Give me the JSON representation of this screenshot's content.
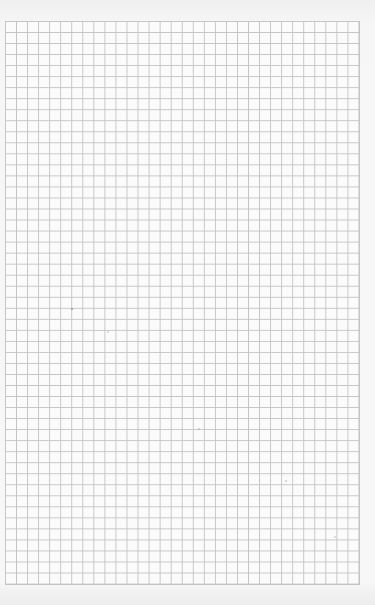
{
  "page": {
    "type": "graph-paper",
    "grid": {
      "columns": 32,
      "rows": 51,
      "line_color": "#c4c4c4",
      "background_color": "#fbfbfb"
    },
    "paper_color": "#f3f3f3"
  }
}
